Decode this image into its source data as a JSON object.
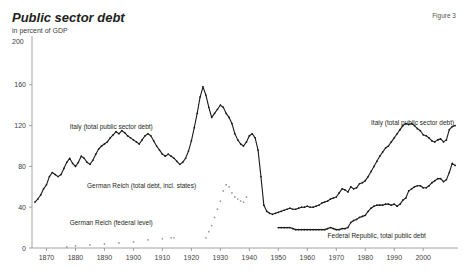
{
  "header": {
    "title": "Public sector debt",
    "subtitle": "in percent of GDP",
    "figure_label": "Figure 3",
    "y_axis_top_label": "200"
  },
  "chart_data": {
    "type": "line",
    "title": "Public sector debt",
    "subtitle": "in percent of GDP",
    "xlabel": "",
    "ylabel": "in percent of GDP",
    "ylim": [
      0,
      200
    ],
    "xlim": [
      1865,
      2012
    ],
    "yticks": [
      0,
      40,
      80,
      120,
      160,
      200
    ],
    "xticks": [
      1870,
      1880,
      1890,
      1900,
      1910,
      1920,
      1930,
      1940,
      1950,
      1960,
      1970,
      1980,
      1990,
      2000
    ],
    "grid": false,
    "legend_position": "inline-annotations",
    "annotations": [
      {
        "text": "Italy (total public sector debt)",
        "x": 1878,
        "y": 118
      },
      {
        "text": "Italy (total public sector debt)",
        "x": 1982,
        "y": 122
      },
      {
        "text": "German Reich (total debt, incl. states)",
        "x": 1884,
        "y": 60
      },
      {
        "text": "German Reich (federal level)",
        "x": 1878,
        "y": 24
      },
      {
        "text": "Federal Republic, total public debt",
        "x": 1967,
        "y": 11
      }
    ],
    "series": [
      {
        "name": "Italy (total public sector debt)",
        "color": "#1a1a1a",
        "style": "line-with-markers",
        "points": [
          [
            1866,
            45
          ],
          [
            1867,
            48
          ],
          [
            1868,
            52
          ],
          [
            1869,
            58
          ],
          [
            1870,
            62
          ],
          [
            1871,
            70
          ],
          [
            1872,
            74
          ],
          [
            1873,
            72
          ],
          [
            1874,
            70
          ],
          [
            1875,
            72
          ],
          [
            1876,
            78
          ],
          [
            1877,
            84
          ],
          [
            1878,
            88
          ],
          [
            1879,
            83
          ],
          [
            1880,
            80
          ],
          [
            1881,
            84
          ],
          [
            1882,
            90
          ],
          [
            1883,
            88
          ],
          [
            1884,
            84
          ],
          [
            1885,
            82
          ],
          [
            1886,
            86
          ],
          [
            1887,
            92
          ],
          [
            1888,
            97
          ],
          [
            1889,
            100
          ],
          [
            1890,
            102
          ],
          [
            1891,
            104
          ],
          [
            1892,
            108
          ],
          [
            1893,
            111
          ],
          [
            1894,
            114
          ],
          [
            1895,
            112
          ],
          [
            1896,
            115
          ],
          [
            1897,
            113
          ],
          [
            1898,
            110
          ],
          [
            1899,
            108
          ],
          [
            1900,
            106
          ],
          [
            1901,
            104
          ],
          [
            1902,
            102
          ],
          [
            1903,
            106
          ],
          [
            1904,
            110
          ],
          [
            1905,
            112
          ],
          [
            1906,
            110
          ],
          [
            1907,
            105
          ],
          [
            1908,
            100
          ],
          [
            1909,
            96
          ],
          [
            1910,
            92
          ],
          [
            1911,
            90
          ],
          [
            1912,
            92
          ],
          [
            1913,
            90
          ],
          [
            1914,
            88
          ],
          [
            1915,
            85
          ],
          [
            1916,
            82
          ],
          [
            1917,
            84
          ],
          [
            1918,
            88
          ],
          [
            1919,
            95
          ],
          [
            1920,
            105
          ],
          [
            1921,
            118
          ],
          [
            1922,
            132
          ],
          [
            1923,
            148
          ],
          [
            1924,
            158
          ],
          [
            1925,
            150
          ],
          [
            1926,
            138
          ],
          [
            1927,
            128
          ],
          [
            1928,
            132
          ],
          [
            1929,
            136
          ],
          [
            1930,
            140
          ],
          [
            1931,
            138
          ],
          [
            1932,
            132
          ],
          [
            1933,
            128
          ],
          [
            1934,
            122
          ],
          [
            1935,
            112
          ],
          [
            1936,
            106
          ],
          [
            1937,
            102
          ],
          [
            1938,
            100
          ],
          [
            1939,
            104
          ],
          [
            1940,
            110
          ],
          [
            1941,
            112
          ],
          [
            1942,
            108
          ],
          [
            1943,
            96
          ],
          [
            1944,
            70
          ],
          [
            1945,
            42
          ],
          [
            1946,
            36
          ],
          [
            1947,
            34
          ],
          [
            1948,
            33
          ],
          [
            1949,
            34
          ],
          [
            1950,
            35
          ],
          [
            1951,
            36
          ],
          [
            1952,
            37
          ],
          [
            1953,
            38
          ],
          [
            1954,
            39
          ],
          [
            1955,
            38
          ],
          [
            1956,
            38
          ],
          [
            1957,
            39
          ],
          [
            1958,
            40
          ],
          [
            1959,
            40
          ],
          [
            1960,
            41
          ],
          [
            1961,
            40
          ],
          [
            1962,
            40
          ],
          [
            1963,
            41
          ],
          [
            1964,
            42
          ],
          [
            1965,
            44
          ],
          [
            1966,
            45
          ],
          [
            1967,
            46
          ],
          [
            1968,
            48
          ],
          [
            1969,
            49
          ],
          [
            1970,
            50
          ],
          [
            1971,
            54
          ],
          [
            1972,
            58
          ],
          [
            1973,
            57
          ],
          [
            1974,
            55
          ],
          [
            1975,
            60
          ],
          [
            1976,
            58
          ],
          [
            1977,
            59
          ],
          [
            1978,
            63
          ],
          [
            1979,
            64
          ],
          [
            1980,
            66
          ],
          [
            1981,
            70
          ],
          [
            1982,
            75
          ],
          [
            1983,
            80
          ],
          [
            1984,
            85
          ],
          [
            1985,
            90
          ],
          [
            1986,
            94
          ],
          [
            1987,
            98
          ],
          [
            1988,
            100
          ],
          [
            1989,
            104
          ],
          [
            1990,
            108
          ],
          [
            1991,
            112
          ],
          [
            1992,
            116
          ],
          [
            1993,
            120
          ],
          [
            1994,
            122
          ],
          [
            1995,
            121
          ],
          [
            1996,
            122
          ],
          [
            1997,
            120
          ],
          [
            1998,
            117
          ],
          [
            1999,
            115
          ],
          [
            2000,
            111
          ],
          [
            2001,
            110
          ],
          [
            2002,
            108
          ],
          [
            2003,
            105
          ],
          [
            2004,
            104
          ],
          [
            2005,
            106
          ],
          [
            2006,
            107
          ],
          [
            2007,
            104
          ],
          [
            2008,
            106
          ],
          [
            2009,
            116
          ],
          [
            2010,
            119
          ],
          [
            2011,
            120
          ]
        ]
      },
      {
        "name": "German Reich (total debt, incl. states)",
        "color": "#9a9a9a",
        "style": "dotted-markers",
        "points": [
          [
            1925,
            10
          ],
          [
            1926,
            16
          ],
          [
            1927,
            22
          ],
          [
            1928,
            30
          ],
          [
            1929,
            38
          ],
          [
            1930,
            46
          ],
          [
            1931,
            56
          ],
          [
            1932,
            62
          ],
          [
            1933,
            60
          ],
          [
            1934,
            54
          ],
          [
            1935,
            50
          ],
          [
            1936,
            48
          ],
          [
            1937,
            46
          ],
          [
            1938,
            45
          ],
          [
            1939,
            50
          ]
        ]
      },
      {
        "name": "German Reich (federal level)",
        "color": "#9a9a9a",
        "style": "dotted-markers",
        "points": [
          [
            1877,
            1
          ],
          [
            1880,
            2
          ],
          [
            1885,
            3
          ],
          [
            1890,
            4
          ],
          [
            1895,
            5
          ],
          [
            1900,
            6
          ],
          [
            1905,
            8
          ],
          [
            1910,
            9
          ],
          [
            1913,
            10
          ],
          [
            1914,
            10
          ]
        ]
      },
      {
        "name": "Federal Republic, total public debt",
        "color": "#1a1a1a",
        "style": "line-with-markers",
        "points": [
          [
            1950,
            20
          ],
          [
            1951,
            20
          ],
          [
            1952,
            20
          ],
          [
            1953,
            20
          ],
          [
            1954,
            20
          ],
          [
            1955,
            19
          ],
          [
            1956,
            18
          ],
          [
            1957,
            18
          ],
          [
            1958,
            18
          ],
          [
            1959,
            18
          ],
          [
            1960,
            18
          ],
          [
            1961,
            18
          ],
          [
            1962,
            18
          ],
          [
            1963,
            18
          ],
          [
            1964,
            18
          ],
          [
            1965,
            18
          ],
          [
            1966,
            18
          ],
          [
            1967,
            19
          ],
          [
            1968,
            20
          ],
          [
            1969,
            19
          ],
          [
            1970,
            18
          ],
          [
            1971,
            18
          ],
          [
            1972,
            19
          ],
          [
            1973,
            19
          ],
          [
            1974,
            20
          ],
          [
            1975,
            25
          ],
          [
            1976,
            27
          ],
          [
            1977,
            28
          ],
          [
            1978,
            30
          ],
          [
            1979,
            31
          ],
          [
            1980,
            32
          ],
          [
            1981,
            36
          ],
          [
            1982,
            39
          ],
          [
            1983,
            41
          ],
          [
            1984,
            42
          ],
          [
            1985,
            42
          ],
          [
            1986,
            42
          ],
          [
            1987,
            43
          ],
          [
            1988,
            43
          ],
          [
            1989,
            42
          ],
          [
            1990,
            43
          ],
          [
            1991,
            41
          ],
          [
            1992,
            43
          ],
          [
            1993,
            47
          ],
          [
            1994,
            49
          ],
          [
            1995,
            56
          ],
          [
            1996,
            58
          ],
          [
            1997,
            60
          ],
          [
            1998,
            61
          ],
          [
            1999,
            61
          ],
          [
            2000,
            59
          ],
          [
            2001,
            59
          ],
          [
            2002,
            61
          ],
          [
            2003,
            64
          ],
          [
            2004,
            66
          ],
          [
            2005,
            68
          ],
          [
            2006,
            68
          ],
          [
            2007,
            65
          ],
          [
            2008,
            67
          ],
          [
            2009,
            74
          ],
          [
            2010,
            83
          ],
          [
            2011,
            81
          ]
        ]
      }
    ]
  }
}
